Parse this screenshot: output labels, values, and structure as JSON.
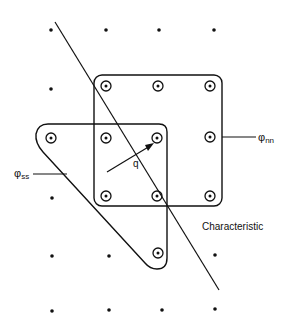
{
  "diagram": {
    "labels": {
      "phi_nn": {
        "base": "φ",
        "sub": "nn"
      },
      "phi_ss": {
        "base": "φ",
        "sub": "ss"
      },
      "q": "q",
      "characteristic": "Characteristic"
    },
    "colors": {
      "ink": "#111111",
      "background": "#ffffff"
    },
    "grid_dots": [
      [
        51,
        30
      ],
      [
        106,
        30
      ],
      [
        159,
        30
      ],
      [
        214,
        30
      ],
      [
        51,
        89
      ],
      [
        52,
        198
      ],
      [
        52,
        256
      ],
      [
        109,
        256
      ],
      [
        215,
        255
      ],
      [
        52,
        311
      ],
      [
        109,
        310
      ],
      [
        162,
        310
      ],
      [
        215,
        309
      ]
    ],
    "circled_nodes": [
      [
        106,
        86
      ],
      [
        158,
        86
      ],
      [
        210,
        86
      ],
      [
        51,
        138
      ],
      [
        106,
        138
      ],
      [
        157,
        138
      ],
      [
        210,
        137
      ],
      [
        106,
        196
      ],
      [
        157,
        196
      ],
      [
        210,
        196
      ],
      [
        158,
        253
      ]
    ]
  }
}
